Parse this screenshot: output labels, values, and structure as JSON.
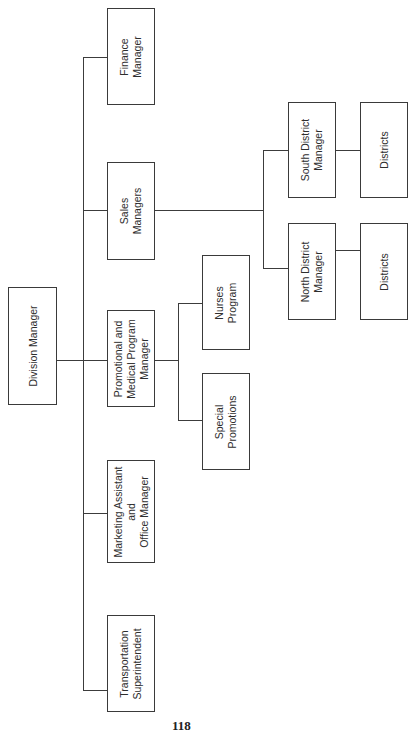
{
  "chart": {
    "title_fragment": "... Division",
    "orientation": "rotated 90° counter-clockwise",
    "page_number": "118"
  },
  "nodes": {
    "division_manager": "Division Manager",
    "finance_manager": "Finance\nManager",
    "sales_managers": "Sales\nManagers",
    "promotional_medical": "Promotional and\nMedical Program\nManager",
    "marketing_assistant": "Marketing Assistant\nand\nOffice Manager",
    "transportation": "Transportation\nSuperintendent",
    "nurses_program": "Nurses\nProgram",
    "special_promotions": "Special\nPromotions",
    "south_district_manager": "South District\nManager",
    "north_district_manager": "North District\nManager",
    "south_districts": "Districts",
    "north_districts": "Districts"
  },
  "hierarchy": {
    "Division Manager": [
      "Finance Manager",
      "Sales Managers",
      "Promotional and Medical Program Manager",
      "Marketing Assistant and Office Manager",
      "Transportation Superintendent"
    ],
    "Sales Managers": [
      "South District Manager",
      "North District Manager"
    ],
    "South District Manager": [
      "Districts"
    ],
    "North District Manager": [
      "Districts"
    ],
    "Promotional and Medical Program Manager": [
      "Nurses Program",
      "Special Promotions"
    ]
  }
}
